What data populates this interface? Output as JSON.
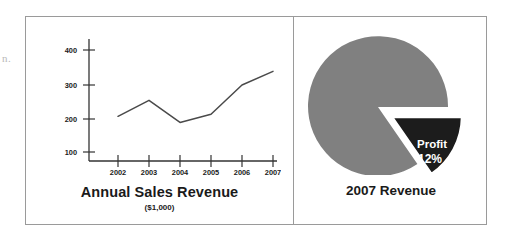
{
  "figure": {
    "margin_fragment": "n.",
    "panels": [
      {
        "name": "annual-sales-revenue",
        "caption": "Annual Sales Revenue",
        "subcaption": "($1,000)"
      },
      {
        "name": "2007-revenue",
        "caption": "2007 Revenue"
      }
    ]
  },
  "chart_data": [
    {
      "type": "line",
      "title": "Annual Sales Revenue",
      "subtitle": "($1,000)",
      "xlabel": "",
      "ylabel": "",
      "categories": [
        "2002",
        "2003",
        "2004",
        "2005",
        "2006",
        "2007"
      ],
      "values": [
        205,
        252,
        187,
        211,
        297,
        337
      ],
      "yticks": [
        100,
        200,
        300,
        400
      ],
      "ylim": [
        0,
        430
      ],
      "grid": false,
      "legend": false,
      "series": [
        {
          "name": "Annual Sales Revenue",
          "values": [
            205,
            252,
            187,
            211,
            297,
            337
          ]
        }
      ],
      "line_color": "#4a4a4a"
    },
    {
      "type": "pie",
      "title": "2007 Revenue",
      "labels": [
        "Profit",
        "Other"
      ],
      "values": [
        12,
        88
      ],
      "slice_labels": [
        "Profit\n12%",
        ""
      ],
      "exploded": [
        "Profit"
      ],
      "colors": [
        "#1c1c1c",
        "#808080"
      ],
      "legend": false,
      "annotations": [
        {
          "text_line1": "Profit",
          "text_line2": "12%",
          "color": "#ffffff"
        }
      ]
    }
  ],
  "colors": {
    "pie_main": "#808080",
    "pie_wedge": "#1c1c1c",
    "line": "#4a4a4a",
    "axis": "#333333",
    "border": "#9a9a9a",
    "text": "#1a1a1a",
    "wedge_text": "#ffffff"
  },
  "axis": {
    "y_ticks": [
      "400",
      "300",
      "200",
      "100"
    ],
    "x_ticks": [
      "2002",
      "2003",
      "2004",
      "2005",
      "2006",
      "2007"
    ]
  },
  "pie_labels": {
    "profit_name": "Profit",
    "profit_pct": "12%"
  }
}
